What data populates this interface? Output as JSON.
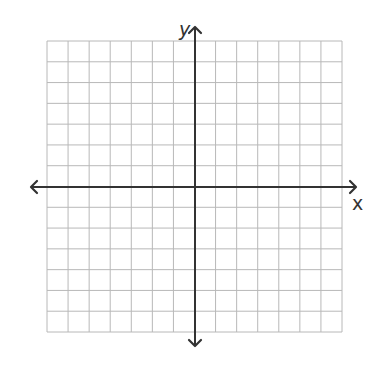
{
  "chart_data": {
    "type": "coordinate-plane",
    "title": "",
    "xlabel": "x",
    "ylabel": "y",
    "xlim": [
      -7,
      7
    ],
    "ylim": [
      -7,
      7
    ],
    "grid": true,
    "grid_cells": {
      "columns": 14,
      "rows": 14
    },
    "tick_labels": [],
    "series": [],
    "axes_arrows": {
      "x": "both-ends",
      "y": "both-ends"
    }
  },
  "labels": {
    "x_axis": "x",
    "y_axis": "y"
  },
  "colors": {
    "background": "#ffffff",
    "grid_line": "#b8b8b8",
    "axis_line": "#333333",
    "label": "#333333"
  },
  "layout": {
    "grid_left": 47,
    "grid_top": 41,
    "grid_right": 342,
    "grid_bottom": 332,
    "origin_x": 195,
    "origin_y": 187,
    "x_axis_start": 31,
    "x_axis_end": 356,
    "y_axis_start": 27,
    "y_axis_end": 346
  }
}
